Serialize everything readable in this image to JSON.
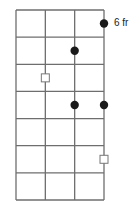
{
  "diagram": {
    "type": "fretboard-chord-diagram",
    "fret_label": "6 fr",
    "strings": 4,
    "frets": 7,
    "grid": {
      "left": 16,
      "right": 104,
      "top": 10,
      "bottom": 200
    },
    "colors": {
      "line": "#6e6e6e",
      "dot": "#1a1a1a",
      "square_fill": "#ffffff",
      "square_stroke": "#777777"
    },
    "markers": [
      {
        "kind": "filled-dot",
        "string": 4,
        "fret": 1
      },
      {
        "kind": "filled-dot",
        "string": 3,
        "fret": 2
      },
      {
        "kind": "hollow-square",
        "string": 2,
        "fret": 3
      },
      {
        "kind": "filled-dot",
        "string": 3,
        "fret": 4
      },
      {
        "kind": "filled-dot",
        "string": 4,
        "fret": 4
      },
      {
        "kind": "hollow-square",
        "string": 4,
        "fret": 6
      }
    ]
  }
}
